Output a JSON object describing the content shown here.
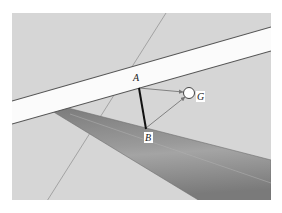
{
  "diagram": {
    "type": "3d-geometry-scene",
    "colors": {
      "background": "#ffffff",
      "ground_plane": "#d6d6d6",
      "white_bar": "#fbfbfb",
      "bar_edge": "#666666",
      "dark_beam": "#8a8a8a",
      "dark_beam_edge": "#6e6e6e",
      "thin_line": "#8c8c8c",
      "segment_ab": "#111111",
      "vector": "#777777"
    },
    "points": [
      {
        "id": "A",
        "label": "A"
      },
      {
        "id": "B",
        "label": "B"
      },
      {
        "id": "G",
        "label": "G"
      }
    ],
    "segments": [
      {
        "from": "A",
        "to": "B",
        "style": "thick"
      },
      {
        "from": "A",
        "to": "G",
        "style": "arrow"
      },
      {
        "from": "B",
        "to": "G",
        "style": "arrow"
      }
    ]
  }
}
